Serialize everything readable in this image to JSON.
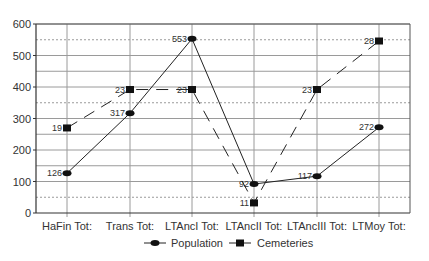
{
  "chart_data": {
    "type": "line",
    "title": "",
    "xlabel": "",
    "ylabel": "",
    "ylim": [
      0,
      600
    ],
    "yticks": [
      0,
      100,
      200,
      300,
      400,
      500,
      600
    ],
    "grid": {
      "solid": [
        100,
        150,
        200,
        250,
        300,
        400,
        450,
        500,
        600
      ],
      "dashed": [
        50,
        350,
        550
      ]
    },
    "categories": [
      "HaFin Tot:",
      "Trans Tot:",
      "LTAncI Tot:",
      "LTAncII Tot:",
      "LTAncIII Tot:",
      "LTMoy Tot:"
    ],
    "series": [
      {
        "name": "Population",
        "marker": "circle",
        "linestyle": "solid",
        "values": [
          126,
          317,
          553,
          92,
          117,
          272
        ],
        "labels": [
          "126",
          "317",
          "553",
          "92",
          "117",
          "272"
        ]
      },
      {
        "name": "Cemeteries",
        "marker": "square",
        "linestyle": "dashed",
        "values": [
          270,
          392,
          392,
          32,
          392,
          546
        ],
        "labels": [
          "19",
          "23",
          "23",
          "11",
          "23",
          "28"
        ]
      }
    ],
    "legend_position": "bottom"
  }
}
